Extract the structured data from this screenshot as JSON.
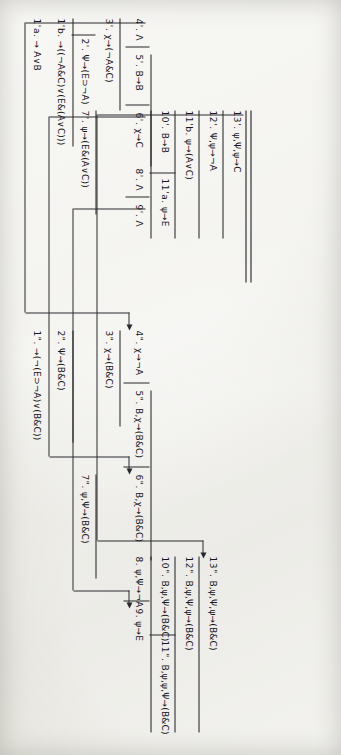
{
  "figure": {
    "ink_color": "#1d1d20",
    "paper_color": "#e9e8e2",
    "rotation_degrees": 90
  },
  "blocks": {
    "base": {
      "name": "root-endsequent-block",
      "lines": [
        {
          "label": "1'a.",
          "sequent": "→ A∨B"
        },
        {
          "label": "1'b.",
          "sequent": "→((¬A&C)∨(E&(A∨C)))"
        },
        {
          "label": "2'.",
          "sequent": "Ψ→(E⊃¬A)"
        },
        {
          "label": "3'.",
          "sequent": "χ→(¬A&C)"
        },
        {
          "label": "4'.",
          "sequent": "Λ"
        },
        {
          "label": "5'.",
          "sequent": "B→B"
        },
        {
          "label": "6'.",
          "sequent": "χ→C"
        },
        {
          "label": "7'.",
          "sequent": "ψ→(E&(A∨C))"
        },
        {
          "label": "8'.",
          "sequent": "Λ"
        },
        {
          "label": "9'.",
          "sequent": "Λ"
        },
        {
          "label": "10'.",
          "sequent": "B→B"
        },
        {
          "label": "11'a.",
          "sequent": "ψ→E"
        },
        {
          "label": "11'b.",
          "sequent": "ψ→(A∨C)"
        },
        {
          "label": "12'.",
          "sequent": "Ψ,ψ→¬A"
        },
        {
          "label": "13'.",
          "sequent": "ψ,Ψ,ψ→C"
        }
      ]
    },
    "second": {
      "name": "second-stage-block",
      "lines": [
        {
          "label": "1\".",
          "sequent": "→(¬(E⊃¬A)∨(B&C))"
        },
        {
          "label": "2\".",
          "sequent": "Ψ→(B&C)"
        },
        {
          "label": "3\".",
          "sequent": "χ→(B&C)"
        },
        {
          "label": "4\".",
          "sequent": "χ→¬A"
        },
        {
          "label": "5\".",
          "sequent": "B,χ→(B&C)"
        },
        {
          "label": "6\".",
          "sequent": "B,χ→(B&C)"
        },
        {
          "label": "7\".",
          "sequent": "ψ,Ψ→(B&C)"
        },
        {
          "label": "8.",
          "sequent": "ψ,Ψ→¬A"
        },
        {
          "label": "9.",
          "sequent": "ψ→E"
        },
        {
          "label": "10\".",
          "sequent": "B,ψ,Ψ→(B&C)"
        },
        {
          "label": "11\".",
          "sequent": "B,ψ,ψ,Ψ→(B&C)"
        },
        {
          "label": "12\".",
          "sequent": "B,ψ,Ψ,ψ→(B&C)"
        },
        {
          "label": "13\".",
          "sequent": "B,ψ,Ψ,ψ→(B&C)"
        }
      ]
    }
  },
  "wires": [
    {
      "name": "wire-4prime-to-4dprime",
      "from_label": "4'.",
      "to_label": "4\"."
    },
    {
      "name": "wire-6prime-to-6dprime",
      "from_label": "6'.",
      "to_label": "6\"."
    },
    {
      "name": "wire-9prime-to-9",
      "from_label": "9'.",
      "to_label": "9."
    },
    {
      "name": "wire-13prime-to-13dprime",
      "from_label": "13'.",
      "to_label": "13\"."
    }
  ]
}
